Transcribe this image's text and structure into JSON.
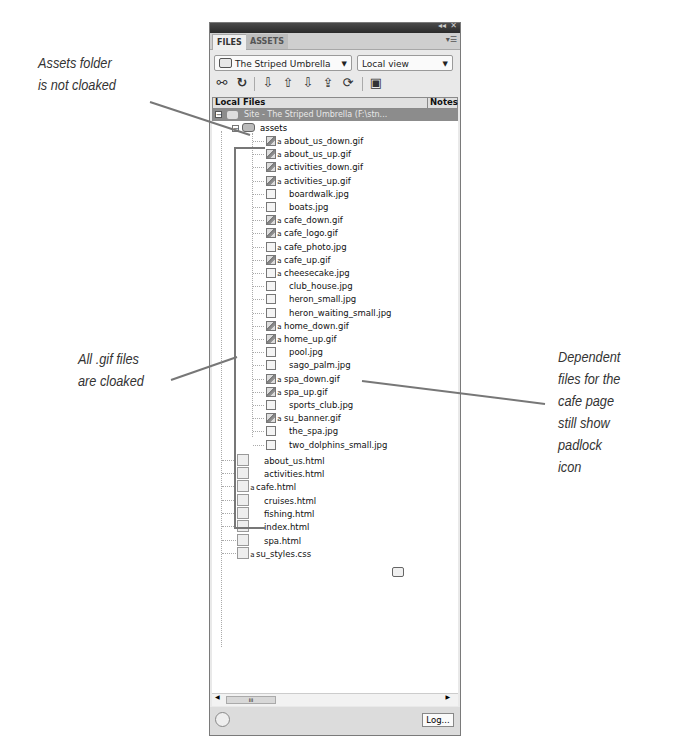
{
  "top_caption_fragment": "the Assets folder is expanded and showing cloaking",
  "panel": {
    "title_controls": [
      "collapse-icon",
      "close-icon"
    ],
    "tabs": [
      {
        "label": "FILES",
        "active": true
      },
      {
        "label": "ASSETS",
        "active": false
      }
    ],
    "site_select": {
      "value": "The Striped Umbrella",
      "icon": "folder-icon"
    },
    "view_select": {
      "value": "Local view"
    },
    "toolbar": [
      {
        "name": "connect-icon",
        "glyph": "⚯"
      },
      {
        "name": "refresh-icon",
        "glyph": "↻"
      },
      {
        "name": "get-files-icon",
        "glyph": "⇩"
      },
      {
        "name": "put-files-icon",
        "glyph": "⇧"
      },
      {
        "name": "check-out-icon",
        "glyph": "⇩"
      },
      {
        "name": "check-in-icon",
        "glyph": "⇪"
      },
      {
        "name": "synchronize-icon",
        "glyph": "⟳"
      },
      {
        "name": "expand-icon",
        "glyph": "▣"
      }
    ],
    "columns": {
      "local_files": "Local Files",
      "notes": "Notes"
    },
    "site_root": "Site - The Striped Umbrella (F:\\stn...",
    "assets_folder": "assets",
    "asset_files": [
      {
        "name": "about_us_down.gif",
        "locked": true,
        "cloaked": true
      },
      {
        "name": "about_us_up.gif",
        "locked": true,
        "cloaked": true
      },
      {
        "name": "activities_down.gif",
        "locked": true,
        "cloaked": true
      },
      {
        "name": "activities_up.gif",
        "locked": true,
        "cloaked": true
      },
      {
        "name": "boardwalk.jpg",
        "locked": false,
        "cloaked": false
      },
      {
        "name": "boats.jpg",
        "locked": false,
        "cloaked": false
      },
      {
        "name": "cafe_down.gif",
        "locked": true,
        "cloaked": true
      },
      {
        "name": "cafe_logo.gif",
        "locked": true,
        "cloaked": true
      },
      {
        "name": "cafe_photo.jpg",
        "locked": true,
        "cloaked": false
      },
      {
        "name": "cafe_up.gif",
        "locked": true,
        "cloaked": true
      },
      {
        "name": "cheesecake.jpg",
        "locked": true,
        "cloaked": false
      },
      {
        "name": "club_house.jpg",
        "locked": false,
        "cloaked": false
      },
      {
        "name": "heron_small.jpg",
        "locked": false,
        "cloaked": false
      },
      {
        "name": "heron_waiting_small.jpg",
        "locked": false,
        "cloaked": false
      },
      {
        "name": "home_down.gif",
        "locked": true,
        "cloaked": true
      },
      {
        "name": "home_up.gif",
        "locked": true,
        "cloaked": true
      },
      {
        "name": "pool.jpg",
        "locked": false,
        "cloaked": false
      },
      {
        "name": "sago_palm.jpg",
        "locked": false,
        "cloaked": false
      },
      {
        "name": "spa_down.gif",
        "locked": true,
        "cloaked": true
      },
      {
        "name": "spa_up.gif",
        "locked": true,
        "cloaked": true
      },
      {
        "name": "sports_club.jpg",
        "locked": false,
        "cloaked": false
      },
      {
        "name": "su_banner.gif",
        "locked": true,
        "cloaked": true
      },
      {
        "name": "the_spa.jpg",
        "locked": false,
        "cloaked": false
      },
      {
        "name": "two_dolphins_small.jpg",
        "locked": false,
        "cloaked": false
      }
    ],
    "root_files": [
      {
        "name": "about_us.html",
        "locked": false,
        "note": false
      },
      {
        "name": "activities.html",
        "locked": false,
        "note": true
      },
      {
        "name": "cafe.html",
        "locked": true,
        "note": false
      },
      {
        "name": "cruises.html",
        "locked": false,
        "note": false
      },
      {
        "name": "fishing.html",
        "locked": false,
        "note": false
      },
      {
        "name": "index.html",
        "locked": false,
        "note": false
      },
      {
        "name": "spa.html",
        "locked": false,
        "note": false
      },
      {
        "name": "su_styles.css",
        "locked": true,
        "note": false
      }
    ],
    "scrollbar_thumb": "III",
    "log_button": "Log..."
  },
  "annotations": {
    "assets_not_cloaked": [
      "Assets folder",
      "is not cloaked"
    ],
    "gif_cloaked": [
      "All .gif files",
      "are cloaked"
    ],
    "dependent_files": [
      "Dependent",
      "files for the",
      "cafe page",
      "still show",
      "padlock",
      "icon"
    ]
  }
}
